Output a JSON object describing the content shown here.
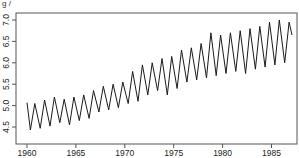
{
  "chart_data": {
    "type": "line",
    "title": "",
    "xlabel": "",
    "ylabel": "",
    "xlim": [
      1959.2,
      1987.8
    ],
    "ylim": [
      4.33,
      7.17
    ],
    "grid": false,
    "legend": null,
    "x_ticks": [
      "1960",
      "1965",
      "1970",
      "1975",
      "1980",
      "1985"
    ],
    "y_ticks": [
      "4.5",
      "5.0",
      "5.5",
      "6.0",
      "6.5",
      "7.0"
    ],
    "top_fragment": "g /",
    "series": [
      {
        "name": "series",
        "x": [
          1960.0,
          1960.35,
          1960.8,
          1961.35,
          1961.8,
          1962.35,
          1962.8,
          1963.35,
          1963.8,
          1964.35,
          1964.8,
          1965.35,
          1965.8,
          1966.35,
          1966.8,
          1967.35,
          1967.8,
          1968.35,
          1968.8,
          1969.35,
          1969.8,
          1970.35,
          1970.8,
          1971.35,
          1971.8,
          1972.35,
          1972.8,
          1973.35,
          1973.8,
          1974.35,
          1974.8,
          1975.35,
          1975.8,
          1976.35,
          1976.8,
          1977.35,
          1977.8,
          1978.35,
          1978.8,
          1979.35,
          1979.8,
          1980.35,
          1980.8,
          1981.35,
          1981.8,
          1982.35,
          1982.8,
          1983.35,
          1983.8,
          1984.35,
          1984.8,
          1985.35,
          1985.8,
          1986.35,
          1986.8
        ],
        "values": [
          5.07,
          4.43,
          5.05,
          4.47,
          5.13,
          4.52,
          5.2,
          4.6,
          5.15,
          4.55,
          5.2,
          4.65,
          5.25,
          4.7,
          5.35,
          4.85,
          5.45,
          4.9,
          5.5,
          4.95,
          5.55,
          5.05,
          5.8,
          5.1,
          5.95,
          5.25,
          6.0,
          5.35,
          6.1,
          5.25,
          6.15,
          5.4,
          6.3,
          5.55,
          6.35,
          5.6,
          6.45,
          5.65,
          6.7,
          5.7,
          6.65,
          5.75,
          6.7,
          5.8,
          6.75,
          5.75,
          6.8,
          5.85,
          6.85,
          5.9,
          6.95,
          5.95,
          7.0,
          6.0,
          6.95
        ],
        "end_value": 6.65,
        "color": "#000000"
      }
    ]
  },
  "colors": {
    "line": "#1a1a1a",
    "axis": "#555555",
    "background": "#ffffff"
  }
}
